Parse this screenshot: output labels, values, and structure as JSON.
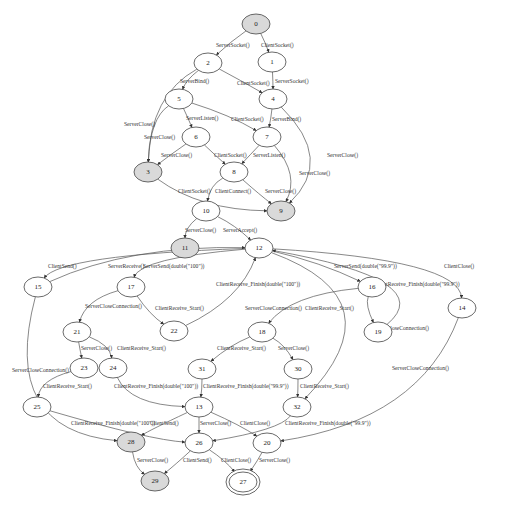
{
  "diagram": {
    "type": "state-machine",
    "nodes": [
      {
        "id": "0",
        "label": "0",
        "style": "shaded"
      },
      {
        "id": "1",
        "label": "1",
        "style": "plain"
      },
      {
        "id": "2",
        "label": "2",
        "style": "plain"
      },
      {
        "id": "4",
        "label": "4",
        "style": "plain"
      },
      {
        "id": "5",
        "label": "5",
        "style": "plain"
      },
      {
        "id": "6",
        "label": "6",
        "style": "plain"
      },
      {
        "id": "7",
        "label": "7",
        "style": "plain"
      },
      {
        "id": "3",
        "label": "3",
        "style": "shaded"
      },
      {
        "id": "8",
        "label": "8",
        "style": "plain"
      },
      {
        "id": "9",
        "label": "9",
        "style": "shaded"
      },
      {
        "id": "10",
        "label": "10",
        "style": "plain"
      },
      {
        "id": "11",
        "label": "11",
        "style": "shaded"
      },
      {
        "id": "12",
        "label": "12",
        "style": "plain"
      },
      {
        "id": "15",
        "label": "15",
        "style": "plain"
      },
      {
        "id": "17",
        "label": "17",
        "style": "plain"
      },
      {
        "id": "16",
        "label": "16",
        "style": "plain"
      },
      {
        "id": "14",
        "label": "14",
        "style": "plain"
      },
      {
        "id": "19",
        "label": "19",
        "style": "plain"
      },
      {
        "id": "22",
        "label": "22",
        "style": "plain"
      },
      {
        "id": "21",
        "label": "21",
        "style": "plain"
      },
      {
        "id": "18",
        "label": "18",
        "style": "plain"
      },
      {
        "id": "23",
        "label": "23",
        "style": "plain"
      },
      {
        "id": "24",
        "label": "24",
        "style": "plain"
      },
      {
        "id": "31",
        "label": "31",
        "style": "plain"
      },
      {
        "id": "30",
        "label": "30",
        "style": "plain"
      },
      {
        "id": "25",
        "label": "25",
        "style": "plain"
      },
      {
        "id": "13",
        "label": "13",
        "style": "plain"
      },
      {
        "id": "32",
        "label": "32",
        "style": "plain"
      },
      {
        "id": "28",
        "label": "28",
        "style": "shaded"
      },
      {
        "id": "26",
        "label": "26",
        "style": "plain"
      },
      {
        "id": "20",
        "label": "20",
        "style": "plain"
      },
      {
        "id": "29",
        "label": "29",
        "style": "shaded"
      },
      {
        "id": "27",
        "label": "27",
        "style": "double"
      }
    ],
    "edges": [
      {
        "from": "0",
        "to": "2",
        "label": "ServerSocket()"
      },
      {
        "from": "0",
        "to": "1",
        "label": "ClientSocket()"
      },
      {
        "from": "2",
        "to": "5",
        "label": "ServerBind()"
      },
      {
        "from": "2",
        "to": "4",
        "label": "ClientSocket()"
      },
      {
        "from": "2",
        "to": "3",
        "label": "ServerClose()"
      },
      {
        "from": "1",
        "to": "4",
        "label": "ServerSocket()"
      },
      {
        "from": "5",
        "to": "6",
        "label": "ServerListen()"
      },
      {
        "from": "5",
        "to": "7",
        "label": "ClientSocket()"
      },
      {
        "from": "5",
        "to": "3",
        "label": "ServerClose()"
      },
      {
        "from": "4",
        "to": "7",
        "label": "ServerBind()"
      },
      {
        "from": "4",
        "to": "9",
        "label": "ServerClose()"
      },
      {
        "from": "6",
        "to": "3",
        "label": "ServerClose()"
      },
      {
        "from": "6",
        "to": "8",
        "label": "ClientSocket()"
      },
      {
        "from": "7",
        "to": "8",
        "label": "ServerListen()"
      },
      {
        "from": "7",
        "to": "9",
        "label": "ServerClose()"
      },
      {
        "from": "3",
        "to": "9",
        "label": "ClientSocket()"
      },
      {
        "from": "8",
        "to": "10",
        "label": "ClientConnect()"
      },
      {
        "from": "8",
        "to": "9",
        "label": "ServerClose()"
      },
      {
        "from": "10",
        "to": "11",
        "label": "ServerClose()"
      },
      {
        "from": "10",
        "to": "12",
        "label": "ServerAccept()"
      },
      {
        "from": "12",
        "to": "15",
        "label": "ClientSend()"
      },
      {
        "from": "12",
        "to": "17",
        "label": "ServerReceive()"
      },
      {
        "from": "15",
        "to": "12",
        "label": "ServerSend(double(\"100\"))"
      },
      {
        "from": "12",
        "to": "16",
        "label": "ServerSend(double(\"99.9\"))"
      },
      {
        "from": "12",
        "to": "14",
        "label": "ClientClose()"
      },
      {
        "from": "22",
        "to": "12",
        "label": "ClientReceive_Finish(double(\"100\"))"
      },
      {
        "from": "19",
        "to": "12",
        "label": "ClientReceive_Finish(double(\"99.9\"))"
      },
      {
        "from": "12",
        "to": "32",
        "label": "ServerCloseConnection()"
      },
      {
        "from": "17",
        "to": "21",
        "label": "ServerCloseConnection()"
      },
      {
        "from": "17",
        "to": "22",
        "label": "ClientReceive_Start()"
      },
      {
        "from": "16",
        "to": "18",
        "label": "ServerCloseConnection()"
      },
      {
        "from": "16",
        "to": "19",
        "label": "ClientReceive_Start()"
      },
      {
        "from": "15",
        "to": "28",
        "label": "ServerCloseConnection()"
      },
      {
        "from": "14",
        "to": "20",
        "label": "ServerCloseConnection()"
      },
      {
        "from": "21",
        "to": "23",
        "label": "ServerClose()"
      },
      {
        "from": "21",
        "to": "24",
        "label": "ClientReceive_Start()"
      },
      {
        "from": "18",
        "to": "31",
        "label": "ClientReceive_Start()"
      },
      {
        "from": "18",
        "to": "30",
        "label": "ServerClose()"
      },
      {
        "from": "23",
        "to": "25",
        "label": "ClientReceive_Start()"
      },
      {
        "from": "24",
        "to": "13",
        "label": "ClientReceive_Finish(double(\"100\"))"
      },
      {
        "from": "31",
        "to": "13",
        "label": "ClientReceive_Finish(double(\"99.9\"))"
      },
      {
        "from": "30",
        "to": "32",
        "label": "ClientReceive_Start()"
      },
      {
        "from": "25",
        "to": "26",
        "label": "ClientReceive_Finish(double(\"100\"))"
      },
      {
        "from": "13",
        "to": "28",
        "label": "ClientSend()"
      },
      {
        "from": "13",
        "to": "26",
        "label": "ServerClose()"
      },
      {
        "from": "13",
        "to": "20",
        "label": "ClientClose()"
      },
      {
        "from": "32",
        "to": "26",
        "label": "ClientReceive_Finish(double(\"99.9\"))"
      },
      {
        "from": "28",
        "to": "29",
        "label": "ServerClose()"
      },
      {
        "from": "26",
        "to": "29",
        "label": "ClientSend()"
      },
      {
        "from": "26",
        "to": "27",
        "label": "ClientClose()"
      },
      {
        "from": "20",
        "to": "27",
        "label": "ServerClose()"
      }
    ]
  }
}
